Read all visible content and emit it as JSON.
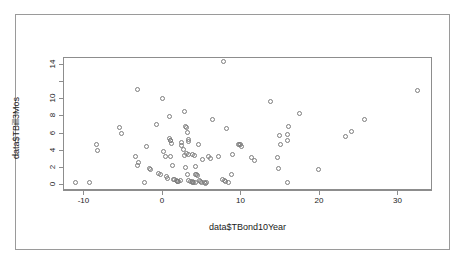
{
  "chart_data": {
    "type": "scatter",
    "title": "",
    "xlabel": "data$TBond10Year",
    "ylabel": "data$TBill3Mos",
    "xlim": [
      -12.6,
      34.4
    ],
    "ylim": [
      -0.7,
      14.8
    ],
    "xticks": [
      -10,
      0,
      10,
      20,
      30
    ],
    "xticklabels": [
      "-10",
      "0",
      "10",
      "20",
      "30"
    ],
    "yticks": [
      0,
      2,
      4,
      6,
      8,
      10,
      12,
      14
    ],
    "yticklabels": [
      "0",
      "2",
      "4",
      "6",
      "8",
      "10",
      "12",
      "14"
    ],
    "grid": false,
    "legend": null,
    "marker": "open-circle",
    "marker_color": "#7d7d7d",
    "points": [
      [
        -11.0,
        0.15
      ],
      [
        -9.1,
        0.1
      ],
      [
        -8.3,
        4.5
      ],
      [
        -8.2,
        3.9
      ],
      [
        -5.3,
        6.5
      ],
      [
        -5.1,
        5.8
      ],
      [
        -3.1,
        10.9
      ],
      [
        -3.3,
        3.2
      ],
      [
        -2.9,
        2.4
      ],
      [
        -3.0,
        2.1
      ],
      [
        -2.2,
        0.15
      ],
      [
        -1.9,
        4.3
      ],
      [
        -1.5,
        1.7
      ],
      [
        -1.4,
        1.6
      ],
      [
        -0.6,
        6.9
      ],
      [
        -0.4,
        1.2
      ],
      [
        -0.1,
        1.0
      ],
      [
        0.2,
        9.9
      ],
      [
        0.3,
        3.7
      ],
      [
        0.5,
        3.2
      ],
      [
        0.6,
        0.8
      ],
      [
        0.8,
        0.55
      ],
      [
        1.0,
        5.2
      ],
      [
        1.1,
        5.05
      ],
      [
        1.2,
        5.0
      ],
      [
        1.3,
        4.7
      ],
      [
        1.0,
        7.8
      ],
      [
        1.2,
        3.1
      ],
      [
        1.4,
        2.15
      ],
      [
        1.5,
        0.5
      ],
      [
        1.7,
        0.45
      ],
      [
        1.9,
        0.3
      ],
      [
        2.0,
        0.25
      ],
      [
        2.1,
        0.2
      ],
      [
        2.2,
        0.18
      ],
      [
        2.4,
        0.3
      ],
      [
        2.5,
        4.8
      ],
      [
        2.6,
        4.4
      ],
      [
        2.8,
        3.95
      ],
      [
        2.9,
        3.3
      ],
      [
        3.0,
        8.4
      ],
      [
        3.1,
        6.7
      ],
      [
        3.2,
        6.5
      ],
      [
        3.3,
        5.9
      ],
      [
        3.4,
        5.1
      ],
      [
        3.5,
        4.9
      ],
      [
        3.4,
        3.4
      ],
      [
        3.2,
        3.5
      ],
      [
        3.1,
        1.9
      ],
      [
        3.3,
        1.0
      ],
      [
        3.5,
        0.35
      ],
      [
        3.7,
        0.25
      ],
      [
        3.9,
        0.2
      ],
      [
        4.0,
        0.15
      ],
      [
        4.1,
        0.1
      ],
      [
        4.3,
        0.12
      ],
      [
        4.0,
        3.35
      ],
      [
        4.2,
        3.3
      ],
      [
        4.3,
        2.0
      ],
      [
        4.5,
        1.05
      ],
      [
        4.4,
        1.0
      ],
      [
        4.6,
        0.95
      ],
      [
        4.8,
        0.3
      ],
      [
        5.0,
        0.25
      ],
      [
        5.1,
        0.15
      ],
      [
        4.7,
        4.6
      ],
      [
        5.2,
        2.75
      ],
      [
        5.5,
        0.1
      ],
      [
        5.6,
        0.05
      ],
      [
        5.8,
        0.12
      ],
      [
        6.0,
        3.2
      ],
      [
        6.2,
        2.95
      ],
      [
        6.5,
        7.5
      ],
      [
        7.3,
        3.2
      ],
      [
        7.9,
        14.2
      ],
      [
        7.8,
        0.45
      ],
      [
        8.0,
        0.3
      ],
      [
        8.2,
        0.2
      ],
      [
        8.3,
        6.4
      ],
      [
        8.5,
        0.15
      ],
      [
        8.9,
        1.05
      ],
      [
        9.0,
        3.35
      ],
      [
        9.8,
        4.6
      ],
      [
        10.0,
        4.55
      ],
      [
        10.1,
        4.5
      ],
      [
        10.2,
        4.35
      ],
      [
        11.5,
        3.0
      ],
      [
        11.8,
        2.7
      ],
      [
        13.9,
        9.6
      ],
      [
        14.8,
        3.0
      ],
      [
        14.9,
        1.75
      ],
      [
        15.1,
        5.6
      ],
      [
        15.2,
        4.6
      ],
      [
        16.0,
        5.75
      ],
      [
        16.1,
        5.0
      ],
      [
        16.2,
        6.7
      ],
      [
        16.0,
        0.1
      ],
      [
        17.6,
        8.1
      ],
      [
        20.0,
        1.6
      ],
      [
        23.4,
        5.5
      ],
      [
        24.2,
        6.1
      ],
      [
        25.9,
        7.4
      ],
      [
        32.6,
        10.8
      ]
    ]
  }
}
